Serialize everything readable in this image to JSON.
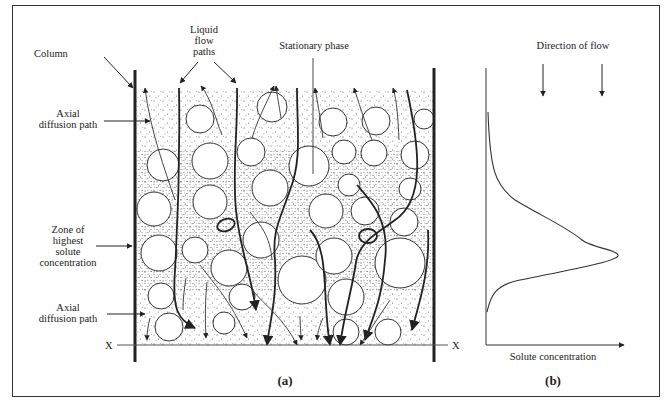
{
  "figure": {
    "panel_a": {
      "caption": "(a)",
      "labels": {
        "column": "Column",
        "liquid_flow_line1": "Liquid",
        "liquid_flow_line2": "flow",
        "liquid_flow_line3": "paths",
        "stationary_phase": "Stationary phase",
        "axial_top_line1": "Axial",
        "axial_top_line2": "diffusion path",
        "zone_line1": "Zone of",
        "zone_line2": "highest",
        "zone_line3": "solute",
        "zone_line4": "concentration",
        "axial_bottom_line1": "Axial",
        "axial_bottom_line2": "diffusion path",
        "x_left": "X",
        "x_right": "X"
      }
    },
    "panel_b": {
      "caption": "(b)",
      "labels": {
        "direction_of_flow": "Direction of flow",
        "x_axis": "Solute concentration"
      }
    }
  },
  "colors": {
    "ink": "#222222",
    "frame": "#333333",
    "background": "#ffffff"
  }
}
